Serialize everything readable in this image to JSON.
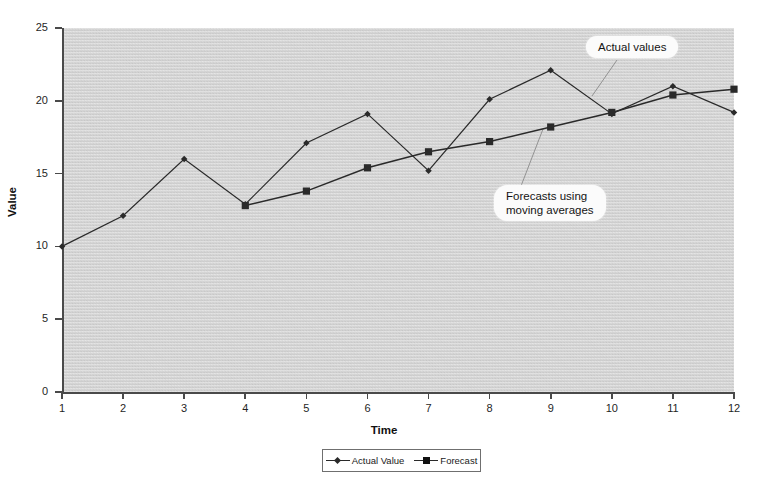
{
  "chart_data": {
    "type": "line",
    "title": "",
    "xlabel": "Time",
    "ylabel": "Value",
    "x": [
      1,
      2,
      3,
      4,
      5,
      6,
      7,
      8,
      9,
      10,
      11,
      12
    ],
    "xtick_labels": [
      "1",
      "2",
      "3",
      "4",
      "5",
      "6",
      "7",
      "8",
      "9",
      "10",
      "11",
      "12"
    ],
    "ytick_labels": [
      "0",
      "5",
      "10",
      "15",
      "20",
      "25"
    ],
    "yticks": [
      0,
      5,
      10,
      15,
      20,
      25
    ],
    "ylim": [
      0,
      25
    ],
    "xlim": [
      1,
      12
    ],
    "grid": false,
    "legend_position": "bottom-center",
    "series": [
      {
        "name": "Actual Value",
        "marker": "diamond",
        "values": [
          10.0,
          12.1,
          16.0,
          12.9,
          17.1,
          19.1,
          15.2,
          20.1,
          22.1,
          19.1,
          21.0,
          19.2
        ]
      },
      {
        "name": "Forecast",
        "marker": "square",
        "values": [
          null,
          null,
          null,
          12.8,
          13.8,
          15.4,
          16.5,
          17.2,
          18.2,
          19.2,
          20.4,
          20.8
        ]
      }
    ],
    "annotations": [
      {
        "id": "actual-values",
        "text": "Actual values",
        "points_to_series": "Actual Value",
        "points_to_x": 9
      },
      {
        "id": "forecasts-moving-averages",
        "text": "Forecasts using\nmoving averages",
        "points_to_series": "Forecast",
        "points_to_x": 9
      }
    ]
  },
  "axes": {
    "x_title": "Time",
    "y_title": "Value"
  },
  "legend": {
    "items": [
      {
        "label": "Actual Value",
        "marker": "diamond"
      },
      {
        "label": "Forecast",
        "marker": "square"
      }
    ]
  },
  "colors": {
    "plot_background": "#d9d9d9",
    "page_background": "#ffffff",
    "line": "#2a2a2a",
    "axis": "#4a4a4a",
    "callout_background": "#fbfbfb",
    "text": "#1a1a1a"
  }
}
